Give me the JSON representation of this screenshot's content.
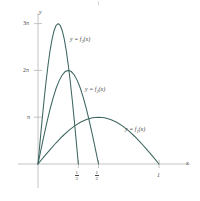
{
  "figure": {
    "title": "",
    "background_color": "#ffffff",
    "curve_color": "#3d6660",
    "axis_color": "#bdbdbd",
    "text_color": "#4a4a4a"
  },
  "axes": {
    "x_axis_label": "x",
    "y_axis_label": "y",
    "x_ticks": [
      {
        "value": 0.3333,
        "label_numerator": "1",
        "label_denominator": "3"
      },
      {
        "value": 0.5,
        "label_numerator": "1",
        "label_denominator": "2"
      },
      {
        "value": 1.0,
        "label_numerator": "1",
        "label_denominator": ""
      }
    ],
    "y_ticks": [
      {
        "value": 3.1416,
        "label": "π"
      },
      {
        "value": 6.2832,
        "label": "2π"
      },
      {
        "value": 9.4248,
        "label": "3π"
      }
    ],
    "xlim": [
      -0.08,
      1.18
    ],
    "ylim": [
      -0.9,
      10.9
    ],
    "grid": false,
    "origin_label": ""
  },
  "curve_labels": [
    {
      "id": "f3",
      "prefix": "y = f",
      "subscript": "3",
      "suffix": "(x)"
    },
    {
      "id": "f2",
      "prefix": "y = f",
      "subscript": "2",
      "suffix": "(x)"
    },
    {
      "id": "f1",
      "prefix": "y = f",
      "subscript": "1",
      "suffix": "(x)"
    }
  ],
  "chart_data": {
    "type": "line",
    "title": "",
    "xlabel": "x",
    "ylabel": "y",
    "xlim": [
      -0.08,
      1.18
    ],
    "ylim": [
      -0.9,
      10.9
    ],
    "grid": false,
    "legend_position": "inline-annotations",
    "x_tick_labels": [
      "1/3",
      "1/2",
      "1"
    ],
    "x_tick_values": [
      0.3333,
      0.5,
      1.0
    ],
    "y_tick_labels": [
      "π",
      "2π",
      "3π"
    ],
    "y_tick_values": [
      3.1416,
      6.2832,
      9.4248
    ],
    "series": [
      {
        "name": "y = f1(x)",
        "formula": "f1(x) = π sin(πx) on [0,1]",
        "peak_x": 0.5,
        "peak_y": 3.1416,
        "support": [
          0.0,
          1.0
        ],
        "x": [
          0.0,
          0.05,
          0.1,
          0.15,
          0.2,
          0.25,
          0.3,
          0.35,
          0.4,
          0.45,
          0.5,
          0.55,
          0.6,
          0.65,
          0.7,
          0.75,
          0.8,
          0.85,
          0.9,
          0.95,
          1.0
        ],
        "y": [
          0.0,
          0.4916,
          0.9708,
          1.4255,
          1.8463,
          2.2214,
          2.5415,
          2.7993,
          2.9878,
          3.1033,
          3.1416,
          3.1033,
          2.9878,
          2.7993,
          2.5415,
          2.2214,
          1.8463,
          1.4255,
          0.9708,
          0.4916,
          0.0
        ]
      },
      {
        "name": "y = f2(x)",
        "formula": "f2(x) = 2π sin(2πx) on [0,1/2]",
        "peak_x": 0.25,
        "peak_y": 6.2832,
        "support": [
          0.0,
          0.5
        ],
        "x": [
          0.0,
          0.025,
          0.05,
          0.075,
          0.1,
          0.125,
          0.15,
          0.175,
          0.2,
          0.225,
          0.25,
          0.275,
          0.3,
          0.325,
          0.35,
          0.375,
          0.4,
          0.425,
          0.45,
          0.475,
          0.5
        ],
        "y": [
          0.0,
          0.9832,
          1.9416,
          2.851,
          3.6926,
          4.4429,
          5.083,
          5.5986,
          5.9756,
          6.2066,
          6.2832,
          6.2066,
          5.9756,
          5.5986,
          5.083,
          4.4429,
          3.6926,
          2.851,
          1.9416,
          0.9832,
          0.0
        ]
      },
      {
        "name": "y = f3(x)",
        "formula": "f3(x) = 3π sin(3πx) on [0,1/3]",
        "peak_x": 0.1667,
        "peak_y": 9.4248,
        "support": [
          0.0,
          0.3333
        ],
        "x": [
          0.0,
          0.0167,
          0.0333,
          0.05,
          0.0667,
          0.0833,
          0.1,
          0.1167,
          0.1333,
          0.15,
          0.1667,
          0.1833,
          0.2,
          0.2167,
          0.2333,
          0.25,
          0.2667,
          0.2833,
          0.3,
          0.3167,
          0.3333
        ],
        "y": [
          0.0,
          1.4748,
          2.9124,
          4.2765,
          5.5389,
          6.6643,
          7.6245,
          8.3979,
          8.9634,
          9.3099,
          9.4248,
          9.3099,
          8.9634,
          8.3979,
          7.6245,
          6.6643,
          5.5389,
          4.2765,
          2.9124,
          1.4748,
          0.0
        ]
      }
    ]
  }
}
